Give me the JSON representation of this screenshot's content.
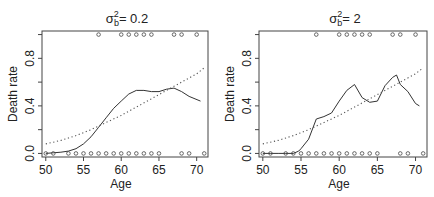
{
  "chart_data": [
    {
      "type": "line",
      "title": "σ_b² = 0.2",
      "title_parts": {
        "symbol": "σ",
        "sup": "2",
        "sub": "b",
        "rest": "= 0.2"
      },
      "xlabel": "Age",
      "ylabel": "Death rate",
      "xlim": [
        49.5,
        71.5
      ],
      "ylim": [
        -0.03,
        1.03
      ],
      "xticks": [
        50,
        55,
        60,
        65,
        70
      ],
      "yticks": [
        0.0,
        0.2,
        0.4,
        0.6,
        0.8,
        1.0
      ],
      "ytick_labels": [
        "0.0",
        "",
        "0.4",
        "",
        "0.8",
        ""
      ],
      "grid": false,
      "frame": {
        "left": 42,
        "top": 31,
        "right": 208,
        "bottom": 157
      },
      "series": [
        {
          "name": "smoothed estimate",
          "style": "solid",
          "x": [
            50,
            51,
            52,
            53,
            54,
            55,
            56,
            57,
            58,
            59,
            60,
            61,
            62,
            63,
            64,
            65,
            66,
            67,
            68,
            69,
            70.5
          ],
          "y": [
            0.0,
            0.005,
            0.01,
            0.02,
            0.04,
            0.08,
            0.14,
            0.22,
            0.3,
            0.38,
            0.44,
            0.5,
            0.53,
            0.53,
            0.52,
            0.52,
            0.54,
            0.55,
            0.52,
            0.48,
            0.44
          ]
        },
        {
          "name": "logistic fit",
          "style": "dotted",
          "x": [
            50,
            52,
            54,
            56,
            58,
            60,
            62,
            64,
            66,
            68,
            70,
            71
          ],
          "y": [
            0.08,
            0.11,
            0.15,
            0.2,
            0.26,
            0.32,
            0.39,
            0.46,
            0.53,
            0.6,
            0.67,
            0.72
          ]
        },
        {
          "name": "observed deaths",
          "style": "points",
          "x": [
            57,
            60,
            61,
            62,
            63,
            64,
            67,
            68,
            70
          ],
          "y": [
            1,
            1,
            1,
            1,
            1,
            1,
            1,
            1,
            1
          ]
        },
        {
          "name": "observed survivors",
          "style": "points",
          "x": [
            50,
            51,
            53,
            54,
            55,
            56,
            57,
            58,
            59,
            60,
            61,
            62,
            63,
            64,
            65,
            68,
            69,
            71
          ],
          "y": [
            0,
            0,
            0,
            0,
            0,
            0,
            0,
            0,
            0,
            0,
            0,
            0,
            0,
            0,
            0,
            0,
            0,
            0
          ]
        }
      ]
    },
    {
      "type": "line",
      "title": "σ_b² = 2",
      "title_parts": {
        "symbol": "σ",
        "sup": "2",
        "sub": "b",
        "rest": "= 2"
      },
      "xlabel": "Age",
      "ylabel": "Death rate",
      "xlim": [
        49.5,
        71.5
      ],
      "ylim": [
        -0.03,
        1.03
      ],
      "xticks": [
        50,
        55,
        60,
        65,
        70
      ],
      "yticks": [
        0.0,
        0.2,
        0.4,
        0.6,
        0.8,
        1.0
      ],
      "ytick_labels": [
        "0.0",
        "",
        "0.4",
        "",
        "0.8",
        ""
      ],
      "grid": false,
      "frame": {
        "left": 259,
        "top": 31,
        "right": 427,
        "bottom": 157
      },
      "series": [
        {
          "name": "smoothed estimate",
          "style": "solid",
          "x": [
            50,
            51,
            52,
            53,
            54,
            54.7,
            55,
            56,
            57,
            58,
            59,
            60,
            61,
            62,
            63,
            64,
            65,
            66,
            67,
            67.5,
            68,
            69,
            70,
            70.5
          ],
          "y": [
            0.0,
            0.0,
            0.0,
            0.0,
            0.0,
            0.02,
            0.04,
            0.12,
            0.29,
            0.31,
            0.34,
            0.44,
            0.53,
            0.58,
            0.47,
            0.43,
            0.44,
            0.57,
            0.64,
            0.66,
            0.58,
            0.52,
            0.42,
            0.4
          ]
        },
        {
          "name": "logistic fit",
          "style": "dotted",
          "x": [
            50,
            52,
            54,
            56,
            58,
            60,
            62,
            64,
            66,
            68,
            70,
            71
          ],
          "y": [
            0.08,
            0.11,
            0.15,
            0.2,
            0.26,
            0.32,
            0.39,
            0.46,
            0.53,
            0.6,
            0.67,
            0.72
          ]
        },
        {
          "name": "observed deaths",
          "style": "points",
          "x": [
            57,
            60,
            61,
            62,
            63,
            64,
            67,
            68,
            70
          ],
          "y": [
            1,
            1,
            1,
            1,
            1,
            1,
            1,
            1,
            1
          ]
        },
        {
          "name": "observed survivors",
          "style": "points",
          "x": [
            50,
            51,
            53,
            54,
            55,
            56,
            57,
            58,
            59,
            60,
            61,
            62,
            63,
            64,
            65,
            68,
            69,
            71
          ],
          "y": [
            0,
            0,
            0,
            0,
            0,
            0,
            0,
            0,
            0,
            0,
            0,
            0,
            0,
            0,
            0,
            0,
            0,
            0
          ]
        }
      ]
    }
  ],
  "colors": {
    "line": "#333333",
    "dotted": "#555555",
    "points": "#444444",
    "frame": "#444444",
    "text": "#222222"
  }
}
